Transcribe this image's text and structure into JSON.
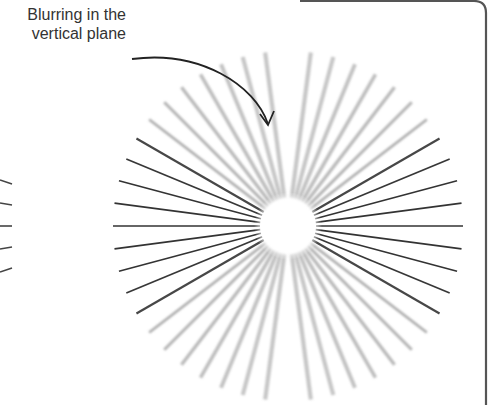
{
  "annotation": {
    "line1": "Blurring in the",
    "line2": "vertical plane"
  },
  "figure": {
    "type": "astigmatism-starburst",
    "center": [
      288,
      226
    ],
    "inner_radius": 28,
    "outer_radius": 175,
    "spoke_count": 48,
    "sharp_color": "#333333",
    "blur_color": "#9a9a9a",
    "frame_color": "#555555"
  }
}
